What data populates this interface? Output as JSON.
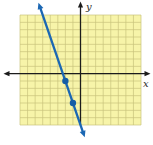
{
  "figure_title": "",
  "colors": {
    "grid_fill": "#f7f4a9",
    "grid_line": "#c9c37c",
    "axis_color": "#1c1c1c",
    "line_color": "#1b67b3",
    "point_color": "#155da6",
    "label_color": "#2b2b2b",
    "background": "#ffffff"
  },
  "chart_data": {
    "type": "line",
    "title": "",
    "xlabel": "x",
    "ylabel": "y",
    "xlim": [
      -8,
      8
    ],
    "ylim": [
      -7,
      8
    ],
    "grid": true,
    "grid_step": 1,
    "legend": false,
    "series": [
      {
        "name": "graphed-line",
        "slope": -3,
        "y_intercept": -7,
        "equation": "y = -3x - 7",
        "arrow_both_ends": true
      }
    ],
    "marked_points": [
      [
        -2,
        -1
      ],
      [
        -1,
        -4
      ]
    ]
  }
}
